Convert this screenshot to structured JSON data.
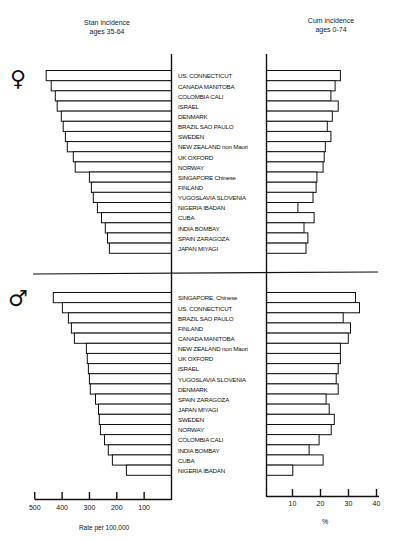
{
  "header": {
    "left_title_line1": "Stan incidence",
    "left_title_line2": "ages 35-64",
    "right_title_line1": "Cum incidence",
    "right_title_line2": "ages 0-74"
  },
  "symbols": {
    "female": "♀",
    "male": "♂"
  },
  "axes": {
    "left_label": "Rate per 100,000",
    "left_ticks": [
      "500",
      "400",
      "300",
      "200",
      "100"
    ],
    "right_label": "%",
    "right_ticks": [
      "10",
      "20",
      "30",
      "40"
    ]
  },
  "chart_data": [
    {
      "type": "bar",
      "title": "Female — Stan incidence ages 35-64 (left) and Cum incidence ages 0-74 (right)",
      "panel": "female",
      "categories": [
        "US, CONNECTICUT",
        "CANADA, MANITOBA",
        "COLOMBIA, CALI",
        "ISRAEL",
        "DENMARK",
        "BRAZIL, SAO PAULO",
        "SWEDEN",
        "NEW ZEALAND non Maori",
        "UK, OXFORD",
        "NORWAY",
        "SINGAPORE, Chinese",
        "FINLAND",
        "YUGOSLAVIA, SLOVENIA",
        "NIGERIA, IBADAN",
        "CUBA",
        "INDIA, BOMBAY",
        "SPAIN, ZARAGOZA",
        "JAPAN, MIYAGI"
      ],
      "series": [
        {
          "name": "Stan incidence ages 35-64 (rate per 100,000)",
          "values": [
            458,
            440,
            425,
            418,
            403,
            396,
            388,
            381,
            359,
            352,
            300,
            293,
            286,
            271,
            256,
            242,
            234,
            227
          ]
        },
        {
          "name": "Cum incidence ages 0-74 (%)",
          "values": [
            26.4,
            24.5,
            23.0,
            25.6,
            23.5,
            21.7,
            23.0,
            21.0,
            20.6,
            20.2,
            18.0,
            17.7,
            16.6,
            11.2,
            17.0,
            13.4,
            14.8,
            14.1
          ]
        }
      ],
      "xlabel_left": "Rate per 100,000",
      "xlim_left": [
        500,
        0
      ],
      "xlabel_right": "%",
      "xlim_right": [
        0,
        40
      ]
    },
    {
      "type": "bar",
      "title": "Male — Stan incidence ages 35-64 (left) and Cum incidence ages 0-74 (right)",
      "panel": "male",
      "categories": [
        "SINGAPORE, Chinese",
        "US, CONNECTICUT",
        "BRAZIL, SAO PAULO",
        "FINLAND",
        "CANADA, MANITOBA",
        "NEW ZEALAND non Maori",
        "UK, OXFORD",
        "ISRAEL",
        "YUGOSLAVIA, SLOVENIA",
        "DENMARK",
        "SPAIN, ZARAGOZA",
        "JAPAN, MIYAGI",
        "SWEDEN",
        "NORWAY",
        "COLOMBIA, CALI",
        "INDIA, BOMBAY",
        "CUBA",
        "NIGERIA, IBADAN"
      ],
      "series": [
        {
          "name": "Stan incidence ages 35-64 (rate per 100,000)",
          "values": [
            432,
            399,
            377,
            366,
            355,
            311,
            308,
            304,
            300,
            297,
            278,
            267,
            264,
            260,
            245,
            231,
            216,
            165
          ]
        },
        {
          "name": "Cum incidence ages 0-74 (%)",
          "values": [
            31.8,
            33.2,
            27.4,
            30.0,
            29.2,
            26.4,
            26.4,
            25.6,
            24.9,
            25.6,
            21.3,
            22.4,
            24.2,
            23.1,
            18.8,
            15.2,
            20.2,
            9.4
          ]
        }
      ],
      "xlabel_left": "Rate per 100,000",
      "xlim_left": [
        500,
        0
      ],
      "xlabel_right": "%",
      "xlim_right": [
        0,
        40
      ]
    }
  ],
  "display_labels": {
    "female": [
      "US. CONNECTICUT",
      "CANADA MANITOBA",
      "COLOMBIA CALI",
      "ISRAEL",
      "DENMARK",
      "BRAZIL SAO PAULO",
      "SWEDEN",
      "NEW ZEALAND non Maori",
      "UK OXFORD",
      "NORWAY",
      "SINGAPORE Chinese",
      "FINLAND",
      "YUGOSLAVIA SLOVENIA",
      "NIGERIA IBADAN",
      "CUBA",
      "INDIA BOMBAY",
      "SPAIN ZARAGOZA",
      "JAPAN MIYAGI"
    ],
    "male": [
      "SINGAPORE, Chinese",
      "US. CONNECTICUT",
      "BRAZIL SAO PAULO",
      "FINLAND",
      "CANADA MANITOBA",
      "NEW ZEALAND non Maori",
      "UK OXFORD",
      "ISRAEL",
      "YUGOSLAVIA SLOVENIA",
      "DENMARK",
      "SPAIN ZARAGOZA",
      "JAPAN MIYAGI",
      "SWEDEN",
      "NORWAY",
      "COLOMBIA CALI",
      "INDIA BOMBAY",
      "CUBA",
      "NIGERIA IBADAN"
    ]
  }
}
